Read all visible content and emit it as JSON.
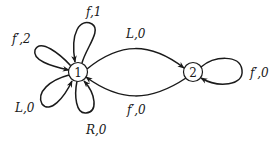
{
  "diagram": {
    "type": "state-transition-graph",
    "nodes": [
      {
        "id": "1",
        "label": "1"
      },
      {
        "id": "2",
        "label": "2"
      }
    ],
    "edges": [
      {
        "from": "1",
        "to": "1",
        "label": "f,1",
        "position": "top-loop"
      },
      {
        "from": "1",
        "to": "1",
        "label": "f′,2",
        "position": "upper-left-loop"
      },
      {
        "from": "1",
        "to": "1",
        "label": "L,0",
        "position": "lower-left-loop"
      },
      {
        "from": "1",
        "to": "1",
        "label": "R,0",
        "position": "bottom-loop"
      },
      {
        "from": "1",
        "to": "2",
        "label": "L,0",
        "position": "upper-arc"
      },
      {
        "from": "2",
        "to": "1",
        "label": "f′,0",
        "position": "lower-arc"
      },
      {
        "from": "2",
        "to": "2",
        "label": "f′,0",
        "position": "right-loop"
      }
    ]
  },
  "colors": {
    "stroke": "#1a1a1a",
    "background": "#ffffff"
  }
}
